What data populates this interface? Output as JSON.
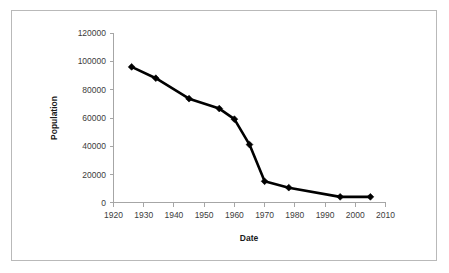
{
  "chart_data": {
    "type": "line",
    "title": "",
    "xlabel": "Date",
    "ylabel": "Population",
    "xlim": [
      1920,
      2010
    ],
    "ylim": [
      0,
      120000
    ],
    "grid": false,
    "legend": "none",
    "x_ticks": [
      "1920",
      "1930",
      "1940",
      "1950",
      "1960",
      "1970",
      "1980",
      "1990",
      "2000",
      "2010"
    ],
    "y_ticks": [
      "0",
      "20000",
      "40000",
      "60000",
      "80000",
      "100000",
      "120000"
    ],
    "series": [
      {
        "name": "Population",
        "marker": "diamond",
        "color": "#000000",
        "x": [
          1926,
          1934,
          1945,
          1955,
          1960,
          1965,
          1970,
          1978,
          1995,
          2005
        ],
        "values": [
          96000,
          88000,
          73500,
          66500,
          59000,
          41000,
          15000,
          10500,
          4000,
          4000
        ]
      }
    ]
  },
  "axes": {
    "x_axis_label": "Date",
    "y_axis_label": "Population",
    "x_tick_labels": [
      "1920",
      "1930",
      "1940",
      "1950",
      "1960",
      "1970",
      "1980",
      "1990",
      "2000",
      "2010"
    ],
    "y_tick_labels": [
      "0",
      "20000",
      "40000",
      "60000",
      "80000",
      "100000",
      "120000"
    ]
  }
}
